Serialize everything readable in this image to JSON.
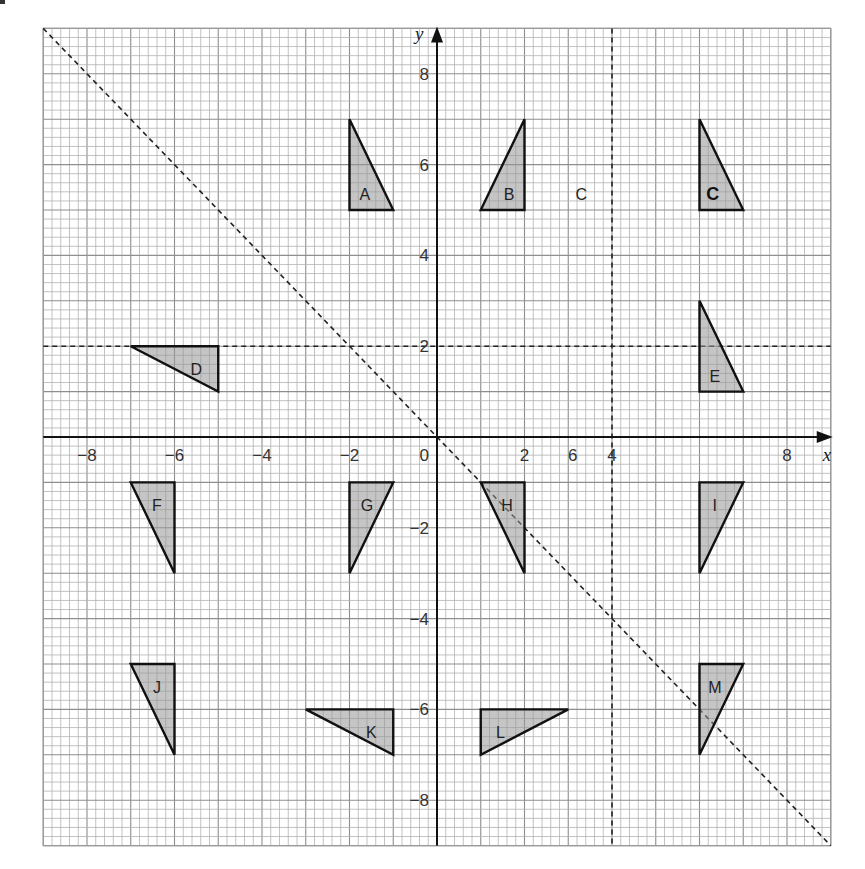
{
  "figure": {
    "x_axis": {
      "name": "x",
      "range": [
        -9,
        9
      ],
      "tick_labels": [
        {
          "value": -8,
          "text": "−8"
        },
        {
          "value": -6,
          "text": "−6"
        },
        {
          "value": -4,
          "text": "−4"
        },
        {
          "value": -2,
          "text": "−2"
        },
        {
          "value": 0,
          "text": "0"
        },
        {
          "value": 2,
          "text": "2"
        },
        {
          "value": 3.1,
          "text": "6"
        },
        {
          "value": 4,
          "text": "4"
        },
        {
          "value": 8,
          "text": "8"
        }
      ]
    },
    "y_axis": {
      "name": "y",
      "range": [
        -9,
        9
      ],
      "tick_labels": [
        {
          "value": 8,
          "text": "8"
        },
        {
          "value": 6,
          "text": "6"
        },
        {
          "value": 4,
          "text": "4"
        },
        {
          "value": 2,
          "text": "2"
        },
        {
          "value": -2,
          "text": "−2"
        },
        {
          "value": -4,
          "text": "−4"
        },
        {
          "value": -6,
          "text": "−6"
        },
        {
          "value": -8,
          "text": "−8"
        }
      ]
    },
    "grid": {
      "minor_per_unit": 5
    },
    "lines": [
      {
        "id": "line-x-equals-4",
        "type": "vertical",
        "x": 4,
        "style": "dashed"
      },
      {
        "id": "line-y-equals-2",
        "type": "horizontal",
        "y": 2,
        "style": "dashed"
      },
      {
        "id": "line-y-equals-minus-x",
        "type": "diagonal",
        "from": [
          -9,
          9
        ],
        "to": [
          9,
          -9
        ],
        "style": "dashed"
      }
    ],
    "triangles": [
      {
        "name": "A",
        "label": "A",
        "vertices": [
          [
            -2,
            7
          ],
          [
            -2,
            5
          ],
          [
            -1,
            5
          ]
        ],
        "label_at": [
          -1.65,
          5.35
        ]
      },
      {
        "name": "B",
        "label": "B",
        "vertices": [
          [
            2,
            7
          ],
          [
            2,
            5
          ],
          [
            1,
            5
          ]
        ],
        "label_at": [
          1.65,
          5.35
        ]
      },
      {
        "name": "G-top",
        "label": "C",
        "bold": true,
        "vertices": [
          [
            6,
            7
          ],
          [
            6,
            5
          ],
          [
            7,
            5
          ]
        ],
        "label_at": [
          6.3,
          5.35
        ]
      },
      {
        "name": "D",
        "label": "D",
        "vertices": [
          [
            -7,
            2
          ],
          [
            -5,
            2
          ],
          [
            -5,
            1
          ]
        ],
        "label_at": [
          -5.5,
          1.5
        ]
      },
      {
        "name": "E",
        "label": "E",
        "vertices": [
          [
            6,
            3
          ],
          [
            6,
            1
          ],
          [
            7,
            1
          ]
        ],
        "label_at": [
          6.35,
          1.35
        ]
      },
      {
        "name": "F",
        "label": "F",
        "vertices": [
          [
            -7,
            -1
          ],
          [
            -6,
            -1
          ],
          [
            -6,
            -3
          ]
        ],
        "label_at": [
          -6.4,
          -1.5
        ]
      },
      {
        "name": "G",
        "label": "G",
        "vertices": [
          [
            -2,
            -1
          ],
          [
            -1,
            -1
          ],
          [
            -2,
            -3
          ]
        ],
        "label_at": [
          -1.6,
          -1.5
        ]
      },
      {
        "name": "H",
        "label": "H",
        "vertices": [
          [
            1,
            -1
          ],
          [
            2,
            -1
          ],
          [
            2,
            -3
          ]
        ],
        "label_at": [
          1.6,
          -1.5
        ]
      },
      {
        "name": "I",
        "label": "I",
        "vertices": [
          [
            6,
            -1
          ],
          [
            7,
            -1
          ],
          [
            6,
            -3
          ]
        ],
        "label_at": [
          6.35,
          -1.5
        ]
      },
      {
        "name": "J",
        "label": "J",
        "vertices": [
          [
            -7,
            -5
          ],
          [
            -6,
            -5
          ],
          [
            -6,
            -7
          ]
        ],
        "label_at": [
          -6.4,
          -5.5
        ]
      },
      {
        "name": "K",
        "label": "K",
        "vertices": [
          [
            -3,
            -6
          ],
          [
            -1,
            -6
          ],
          [
            -1,
            -7
          ]
        ],
        "label_at": [
          -1.5,
          -6.5
        ]
      },
      {
        "name": "L",
        "label": "L",
        "vertices": [
          [
            1,
            -6
          ],
          [
            3,
            -6
          ],
          [
            1,
            -7
          ]
        ],
        "label_at": [
          1.45,
          -6.5
        ]
      },
      {
        "name": "M",
        "label": "M",
        "vertices": [
          [
            6,
            -5
          ],
          [
            7,
            -5
          ],
          [
            6,
            -7
          ]
        ],
        "label_at": [
          6.35,
          -5.5
        ]
      }
    ],
    "free_labels": [
      {
        "name": "C",
        "text": "C",
        "at": [
          3.3,
          5.35
        ]
      }
    ]
  }
}
